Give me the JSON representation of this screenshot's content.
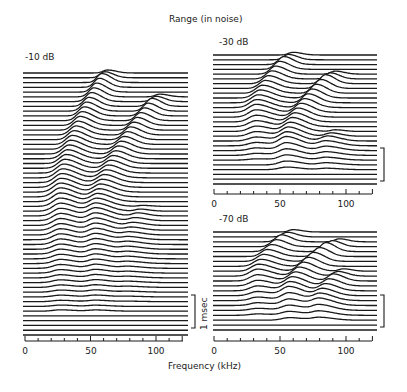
{
  "chart_data": {
    "type": "waterfall",
    "title": "Range (in noise)",
    "xlabel": "Frequency (kHz)",
    "scale_bar_label": "1 msec",
    "panels": [
      {
        "id": "left",
        "label": "-10 dB",
        "x_range": [
          0,
          120
        ],
        "tick_labels": [
          "0",
          "50",
          "100"
        ],
        "tick_values": [
          0,
          50,
          100
        ],
        "n_traces": 56,
        "ridges": [
          {
            "name": "ridge1",
            "start_kHz": 63,
            "end_kHz": 27,
            "start_trace": 0,
            "settle_trace": 26,
            "end_trace": 50,
            "amp": 9
          },
          {
            "name": "ridge2",
            "start_kHz": 103,
            "end_kHz": 54,
            "start_trace": 5,
            "settle_trace": 30,
            "end_trace": 50,
            "amp": 8
          },
          {
            "name": "ridge3",
            "start_kHz": 90,
            "end_kHz": 79,
            "start_trace": 28,
            "settle_trace": 36,
            "end_trace": 48,
            "amp": 3
          }
        ]
      },
      {
        "id": "right-top",
        "label": "-30 dB",
        "x_range": [
          0,
          120
        ],
        "tick_labels": [
          "0",
          "50",
          "100"
        ],
        "tick_values": [
          0,
          50,
          100
        ],
        "n_traces": 28,
        "ridges": [
          {
            "name": "ridge1",
            "start_kHz": 60,
            "end_kHz": 32,
            "start_trace": 0,
            "settle_trace": 12,
            "end_trace": 22,
            "amp": 8
          },
          {
            "name": "ridge2",
            "start_kHz": 92,
            "end_kHz": 55,
            "start_trace": 4,
            "settle_trace": 19,
            "end_trace": 24,
            "amp": 9
          },
          {
            "name": "ridge3",
            "start_kHz": 92,
            "end_kHz": 85,
            "start_trace": 16,
            "settle_trace": 19,
            "end_trace": 24,
            "amp": 5
          }
        ]
      },
      {
        "id": "right-bottom",
        "label": "-70 dB",
        "x_range": [
          0,
          120
        ],
        "tick_labels": [
          "0",
          "50",
          "100"
        ],
        "tick_values": [
          0,
          50,
          100
        ],
        "n_traces": 21,
        "ridges": [
          {
            "name": "ridge1",
            "start_kHz": 60,
            "end_kHz": 33,
            "start_trace": 0,
            "settle_trace": 9,
            "end_trace": 17,
            "amp": 7
          },
          {
            "name": "ridge2",
            "start_kHz": 95,
            "end_kHz": 57,
            "start_trace": 2,
            "settle_trace": 13,
            "end_trace": 18,
            "amp": 9
          },
          {
            "name": "ridge3",
            "start_kHz": 98,
            "end_kHz": 80,
            "start_trace": 8,
            "settle_trace": 15,
            "end_trace": 18,
            "amp": 7
          }
        ]
      }
    ]
  },
  "labels": {
    "title": "Range (in noise)",
    "xlabel": "Frequency (kHz)",
    "panel_left": "-10 dB",
    "panel_right_top": "-30 dB",
    "panel_right_bottom": "-70 dB",
    "scale_bar": "1 msec",
    "tick_0": "0",
    "tick_50": "50",
    "tick_100": "100"
  },
  "colors": {
    "ink": "#1a1a1a",
    "background": "#ffffff"
  }
}
